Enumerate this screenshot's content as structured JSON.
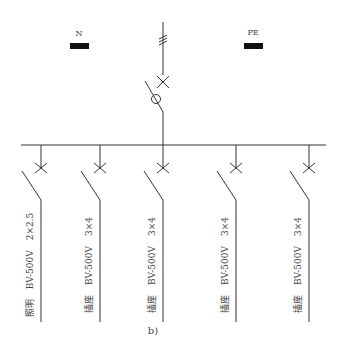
{
  "diagram": {
    "caption": "b)",
    "terminals": [
      {
        "id": "N",
        "label": "N"
      },
      {
        "id": "PE",
        "label": "PE"
      }
    ],
    "incoming": {
      "conductor_ticks": 3,
      "devices": [
        "circuit-breaker",
        "isolating-switch-with-fuse"
      ]
    },
    "branches": [
      {
        "name": "照明",
        "cable": "BV-500V",
        "spec": "2×2.5"
      },
      {
        "name": "插座",
        "cable": "BV-500V",
        "spec": "3×4"
      },
      {
        "name": "插座",
        "cable": "BV-500V",
        "spec": "3×4"
      },
      {
        "name": "插座",
        "cable": "BV-500V",
        "spec": "3×4"
      },
      {
        "name": "插座",
        "cable": "BV-500V",
        "spec": "3×4"
      }
    ]
  }
}
